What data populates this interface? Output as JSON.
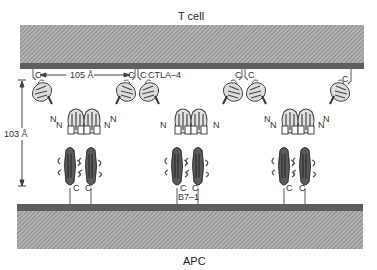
{
  "labels": {
    "top_cell": "T cell",
    "bottom_cell": "APC",
    "horizontal_distance": "105 Å",
    "vertical_distance": "103 Å",
    "receptor": "CTLA–4",
    "ligand": "B7–1",
    "c_terminus": "C",
    "n_terminus": "N"
  },
  "colors": {
    "membrane_bar": "#5e5e5e",
    "hatch_fill": "#a8a8a8",
    "hatch_line": "#6f6f6f",
    "ribbon": "#555555",
    "ribbon_light": "#8a8a8a",
    "text": "#333333"
  },
  "complexes": [
    {
      "id": "complex-1",
      "center_x": 95
    },
    {
      "id": "complex-2",
      "center_x": 185
    },
    {
      "id": "complex-3",
      "center_x": 275
    }
  ]
}
